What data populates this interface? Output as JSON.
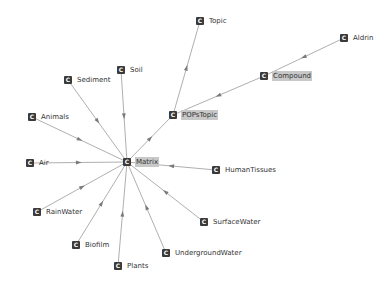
{
  "graph": {
    "nodes": [
      {
        "id": "Topic",
        "label": "Topic",
        "x": 200,
        "y": 21,
        "selected": false
      },
      {
        "id": "Aldrin",
        "label": "Aldrin",
        "x": 344,
        "y": 38,
        "selected": false
      },
      {
        "id": "Compound",
        "label": "Compound",
        "x": 264,
        "y": 76,
        "selected": true
      },
      {
        "id": "POPsTopic",
        "label": "POPsTopic",
        "x": 173,
        "y": 115,
        "selected": true
      },
      {
        "id": "Soil",
        "label": "Soil",
        "x": 121,
        "y": 70,
        "selected": false
      },
      {
        "id": "Sediment",
        "label": "Sediment",
        "x": 68,
        "y": 80,
        "selected": false
      },
      {
        "id": "Animals",
        "label": "Animals",
        "x": 32,
        "y": 117,
        "selected": false
      },
      {
        "id": "Matrix",
        "label": "Matrix",
        "x": 127,
        "y": 162,
        "selected": true
      },
      {
        "id": "Air",
        "label": "Air",
        "x": 30,
        "y": 163,
        "selected": false
      },
      {
        "id": "HumanTissues",
        "label": "HumanTissues",
        "x": 216,
        "y": 170,
        "selected": false
      },
      {
        "id": "RainWater",
        "label": "RainWater",
        "x": 37,
        "y": 212,
        "selected": false
      },
      {
        "id": "SurfaceWater",
        "label": "SurfaceWater",
        "x": 204,
        "y": 222,
        "selected": false
      },
      {
        "id": "Biofilm",
        "label": "Biofilm",
        "x": 76,
        "y": 245,
        "selected": false
      },
      {
        "id": "UndergroundWater",
        "label": "UndergroundWater",
        "x": 166,
        "y": 253,
        "selected": false
      },
      {
        "id": "Plants",
        "label": "Plants",
        "x": 118,
        "y": 266,
        "selected": false
      }
    ],
    "edges": [
      {
        "from": "POPsTopic",
        "to": "Topic"
      },
      {
        "from": "Aldrin",
        "to": "Compound"
      },
      {
        "from": "Compound",
        "to": "POPsTopic"
      },
      {
        "from": "Matrix",
        "to": "POPsTopic"
      },
      {
        "from": "Soil",
        "to": "Matrix"
      },
      {
        "from": "Sediment",
        "to": "Matrix"
      },
      {
        "from": "Animals",
        "to": "Matrix"
      },
      {
        "from": "Air",
        "to": "Matrix"
      },
      {
        "from": "HumanTissues",
        "to": "Matrix"
      },
      {
        "from": "RainWater",
        "to": "Matrix"
      },
      {
        "from": "SurfaceWater",
        "to": "Matrix"
      },
      {
        "from": "Biofilm",
        "to": "Matrix"
      },
      {
        "from": "UndergroundWater",
        "to": "Matrix"
      },
      {
        "from": "Plants",
        "to": "Matrix"
      }
    ],
    "icon_glyph": "C",
    "colors": {
      "edge": "#9a9a9a",
      "arrow": "#7a7a7a",
      "icon": "#3a3a3a",
      "selected_label_bg": "#c8c8c8"
    }
  }
}
